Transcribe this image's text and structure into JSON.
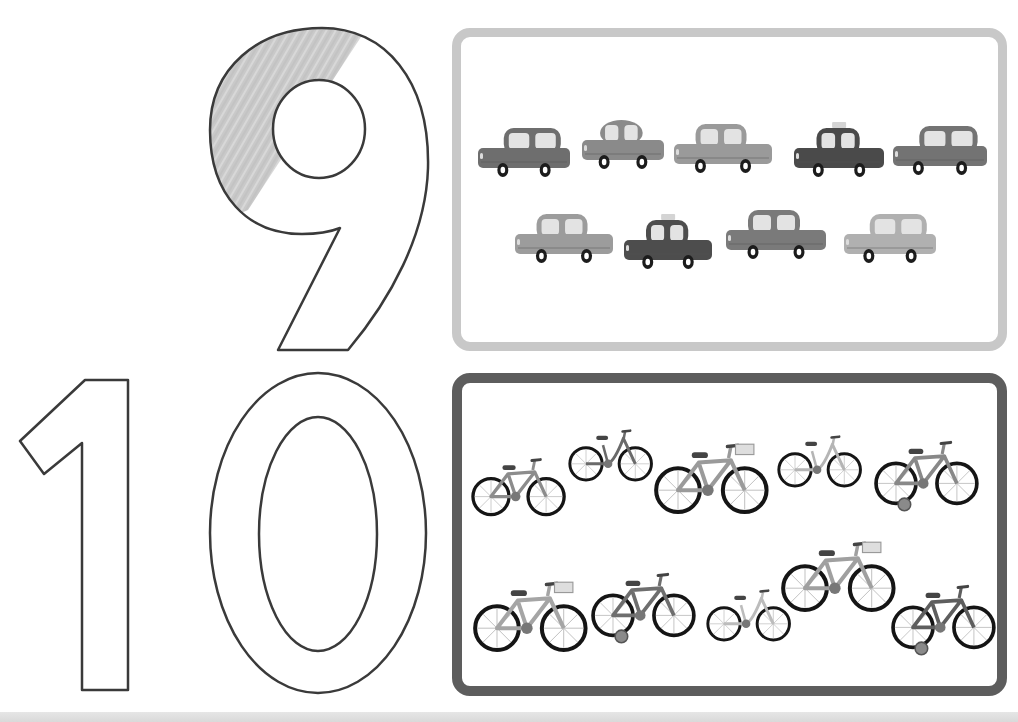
{
  "worksheet": {
    "digits": [
      {
        "value": "9",
        "label": "number nine outline",
        "partially_colored": true
      },
      {
        "value": "10",
        "label": "number ten outline",
        "partially_colored": false
      }
    ],
    "groups": [
      {
        "name": "cars",
        "count": 9,
        "border_color": "#c8c8c8",
        "rows": [
          {
            "items": [
              "hatchback",
              "sedan-round",
              "sedan",
              "taxi",
              "hatchback"
            ]
          },
          {
            "items": [
              "sedan",
              "taxi",
              "pickup-sedan",
              "wagon"
            ]
          }
        ],
        "body_colors": [
          "#6e6e6e",
          "#8a8a8a",
          "#9a9a9a",
          "#4a4a4a",
          "#737373",
          "#9c9c9c",
          "#4d4d4d",
          "#7a7a7a",
          "#b0b0b0"
        ]
      },
      {
        "name": "bicycles",
        "count": 10,
        "border_color": "#5d5d5d",
        "rows": [
          {
            "items": [
              "bike",
              "step-through",
              "bike-basket",
              "step-through",
              "bike-training-wheels"
            ]
          },
          {
            "items": [
              "bike-basket",
              "bike-training-wheels",
              "step-through",
              "bike-basket",
              "bike-training-wheels"
            ]
          }
        ],
        "frame_colors": [
          "#8c8c8c",
          "#6a6a6a",
          "#9a9a9a",
          "#b5b5b5",
          "#888888",
          "#a5a5a5",
          "#6e6e6e",
          "#bcbcbc",
          "#a0a0a0",
          "#5e5e5e"
        ]
      }
    ]
  }
}
